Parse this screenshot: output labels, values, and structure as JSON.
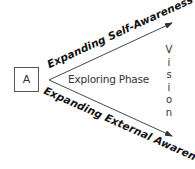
{
  "diagram": {
    "start_box": {
      "label": "A"
    },
    "center_label": "Exploring Phase",
    "upper_arrow": {
      "label": "Expanding Self-Awareness"
    },
    "lower_arrow": {
      "label": "Expanding External Awareness"
    },
    "target": {
      "label": "Vision",
      "letters": [
        "V",
        "i",
        "s",
        "i",
        "o",
        "n"
      ]
    },
    "colors": {
      "line": "#333333",
      "text": "#111111",
      "box_border": "#555555"
    }
  }
}
